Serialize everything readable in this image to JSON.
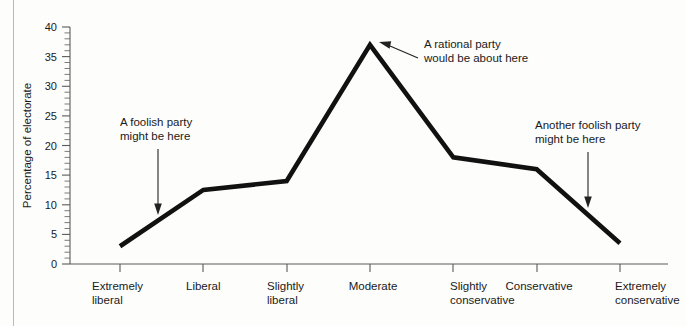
{
  "figure": {
    "background_color": "#fdfdfc",
    "line_color": "#111111",
    "axis_color": "#5a5a5a"
  },
  "axes": {
    "ylabel": "Percentage of electorate",
    "ytick_labels": [
      "0",
      "5",
      "10",
      "15",
      "20",
      "25",
      "30",
      "35",
      "40"
    ],
    "xlabel": ""
  },
  "annotations": [
    {
      "id": "foolish-left",
      "line1": "A foolish party",
      "line2": "might be here"
    },
    {
      "id": "rational",
      "line1": "A rational party",
      "line2": "would be about here"
    },
    {
      "id": "foolish-right",
      "line1": "Another foolish party",
      "line2": "might be here"
    }
  ],
  "chart_data": {
    "type": "line",
    "title": "",
    "xlabel": "",
    "ylabel": "Percentage of electorate",
    "ylim": [
      0,
      40
    ],
    "ytick_step": 5,
    "yminor_step": 1,
    "grid": false,
    "legend": null,
    "categories": [
      "Extremely liberal",
      "Liberal",
      "Slightly liberal",
      "Moderate",
      "Slightly conservative",
      "Conservative",
      "Extremely conservative"
    ],
    "category_lines": [
      [
        "Extremely",
        "liberal"
      ],
      [
        "Liberal",
        ""
      ],
      [
        "Slightly",
        "liberal"
      ],
      [
        "Moderate",
        ""
      ],
      [
        "Slightly",
        "conservative"
      ],
      [
        "Conservative",
        ""
      ],
      [
        "Extremely",
        "conservative"
      ]
    ],
    "values": [
      3,
      12.5,
      14,
      37,
      18,
      16,
      3.5
    ],
    "annotations": [
      "A foolish party might be here",
      "A rational party would be about here",
      "Another foolish party might be here"
    ]
  }
}
